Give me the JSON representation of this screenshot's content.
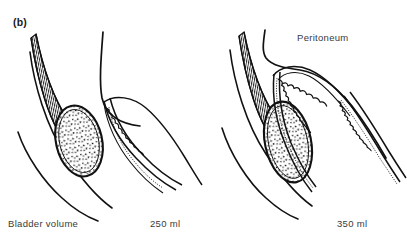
{
  "figure": {
    "panel_label": "(b)",
    "background_color": "#ffffff",
    "ink_color": "#111111",
    "width": 407,
    "height": 247
  },
  "annotations": {
    "peritoneum": "Peritoneum"
  },
  "caption": {
    "row_label": "Bladder volume",
    "values": [
      "250 ml",
      "350 ml"
    ]
  },
  "panels": [
    {
      "id": "left-panel",
      "volume": "250 ml",
      "parts": [
        "abdominal-wall-outline",
        "rectus-muscle-striations",
        "bladder-oval-stippled",
        "uterus-bowel-scalloped",
        "peritoneal-reflection"
      ]
    },
    {
      "id": "right-panel",
      "volume": "350 ml",
      "parts": [
        "abdominal-wall-outline",
        "rectus-muscle-striations",
        "bladder-oval-stippled",
        "uterus-bowel-scalloped",
        "peritoneal-reflection"
      ]
    }
  ]
}
